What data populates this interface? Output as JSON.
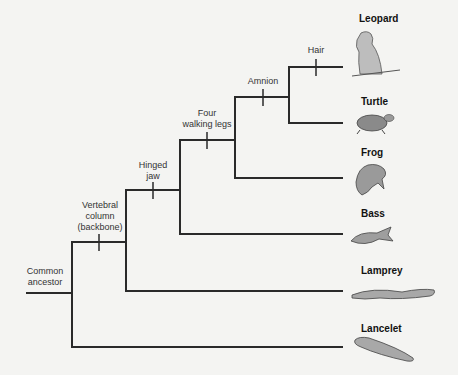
{
  "diagram": {
    "type": "cladogram",
    "root_label": "Common ancestor",
    "taxa": [
      {
        "name": "Leopard",
        "icon": "leopard-icon"
      },
      {
        "name": "Turtle",
        "icon": "turtle-icon"
      },
      {
        "name": "Frog",
        "icon": "frog-icon"
      },
      {
        "name": "Bass",
        "icon": "fish-icon"
      },
      {
        "name": "Lamprey",
        "icon": "lamprey-icon"
      },
      {
        "name": "Lancelet",
        "icon": "lancelet-icon"
      }
    ],
    "traits": [
      {
        "label_line1": "Vertebral",
        "label_line2": "column",
        "label_line3": "(backbone)"
      },
      {
        "label_line1": "Hinged",
        "label_line2": "jaw"
      },
      {
        "label_line1": "Four",
        "label_line2": "walking legs"
      },
      {
        "label_line1": "Amnion"
      },
      {
        "label_line1": "Hair"
      }
    ],
    "root": {
      "line1": "Common",
      "line2": "ancestor"
    }
  }
}
